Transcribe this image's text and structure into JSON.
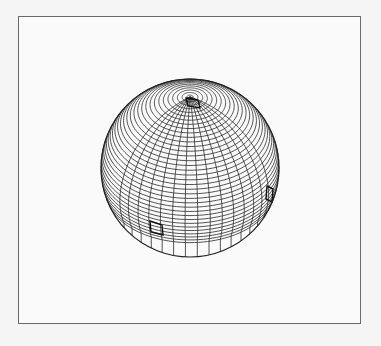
{
  "figure": {
    "canvas": {
      "width": 381,
      "height": 346
    },
    "frame": {
      "x": 18,
      "y": 16,
      "width": 343,
      "height": 308,
      "stroke": "#6a6a6a"
    },
    "sphere": {
      "center": [
        190,
        168
      ],
      "radius": 89,
      "tilt_deg": 37,
      "outline_stroke": "#222222",
      "line_color": "#2a2a2a",
      "latitude_count": 36,
      "latitude_max_deg": 88,
      "meridian_lon_start_deg": -52,
      "meridian_lon_end_deg": 62,
      "meridian_count": 15,
      "meridian_lat_end_deg": -22,
      "bottom_band_lat_deg": -20
    },
    "highlighted_cells": [
      {
        "name": "pole-cell",
        "points": [
          [
            186,
            98
          ],
          [
            198,
            100
          ],
          [
            200,
            108
          ],
          [
            188,
            106
          ]
        ]
      },
      {
        "name": "lower-left-cell",
        "points": [
          [
            150,
            221
          ],
          [
            162,
            225
          ],
          [
            163,
            235
          ],
          [
            151,
            232
          ]
        ]
      },
      {
        "name": "right-cell",
        "points": [
          [
            267,
            186
          ],
          [
            273,
            189
          ],
          [
            272,
            202
          ],
          [
            266,
            199
          ]
        ]
      }
    ]
  }
}
